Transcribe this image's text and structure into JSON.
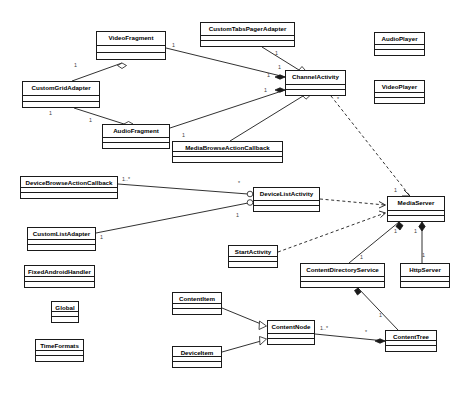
{
  "diagram": {
    "type": "uml-class-diagram",
    "title": "",
    "canvas": {
      "width": 464,
      "height": 394
    },
    "colors": {
      "stroke": "#1a1a1a",
      "fill": "#ffffff",
      "text": "#000000",
      "multiplicity_text": "#3d3d3d"
    },
    "classes": [
      {
        "id": "video_fragment",
        "name": "VideoFragment",
        "x": 96,
        "y": 31,
        "w": 70,
        "h": 29
      },
      {
        "id": "custom_tabs_pager_adapter",
        "name": "CustomTabsPagerAdapter",
        "x": 200,
        "y": 22,
        "w": 95,
        "h": 25
      },
      {
        "id": "audio_player",
        "name": "AudioPlayer",
        "x": 374,
        "y": 32,
        "w": 51,
        "h": 24
      },
      {
        "id": "video_player",
        "name": "VideoPlayer",
        "x": 374,
        "y": 80,
        "w": 51,
        "h": 24
      },
      {
        "id": "custom_grid_adapter",
        "name": "CustomGridAdapter",
        "x": 22,
        "y": 81,
        "w": 78,
        "h": 27
      },
      {
        "id": "channel_activity",
        "name": "ChannelActivity",
        "x": 285,
        "y": 70,
        "w": 61,
        "h": 26
      },
      {
        "id": "audio_fragment",
        "name": "AudioFragment",
        "x": 102,
        "y": 124,
        "w": 68,
        "h": 25
      },
      {
        "id": "media_browse_action_callback",
        "name": "MediaBrowseActionCallback",
        "x": 172,
        "y": 141,
        "w": 111,
        "h": 22
      },
      {
        "id": "device_browse_action_callback",
        "name": "DeviceBrowseActionCallback",
        "x": 20,
        "y": 176,
        "w": 98,
        "h": 23
      },
      {
        "id": "device_list_activity",
        "name": "DeviceListActivity",
        "x": 253,
        "y": 187,
        "w": 67,
        "h": 25
      },
      {
        "id": "media_server",
        "name": "MediaServer",
        "x": 387,
        "y": 196,
        "w": 58,
        "h": 26
      },
      {
        "id": "custom_list_adapter",
        "name": "CustomListAdapter",
        "x": 27,
        "y": 227,
        "w": 69,
        "h": 24
      },
      {
        "id": "start_activity",
        "name": "StartActivity",
        "x": 228,
        "y": 245,
        "w": 50,
        "h": 23
      },
      {
        "id": "content_directory_service",
        "name": "ContentDirectoryService",
        "x": 300,
        "y": 263,
        "w": 85,
        "h": 25
      },
      {
        "id": "http_server",
        "name": "HttpServer",
        "x": 400,
        "y": 263,
        "w": 50,
        "h": 25
      },
      {
        "id": "fixed_android_handler",
        "name": "FixedAndroidHandler",
        "x": 24,
        "y": 265,
        "w": 71,
        "h": 23
      },
      {
        "id": "content_item",
        "name": "ContentItem",
        "x": 172,
        "y": 292,
        "w": 50,
        "h": 23
      },
      {
        "id": "global",
        "name": "Global",
        "x": 51,
        "y": 301,
        "w": 28,
        "h": 22
      },
      {
        "id": "content_node",
        "name": "ContentNode",
        "x": 267,
        "y": 320,
        "w": 48,
        "h": 25
      },
      {
        "id": "content_tree",
        "name": "ContentTree",
        "x": 385,
        "y": 330,
        "w": 52,
        "h": 22
      },
      {
        "id": "time_formats",
        "name": "TimeFormats",
        "x": 35,
        "y": 339,
        "w": 49,
        "h": 23
      },
      {
        "id": "device_item",
        "name": "DeviceItem",
        "x": 172,
        "y": 346,
        "w": 50,
        "h": 22
      }
    ],
    "multiplicities": [
      {
        "id": "m1",
        "label": "1",
        "x": 74,
        "y": 63
      },
      {
        "id": "m2",
        "label": "1",
        "x": 172,
        "y": 43
      },
      {
        "id": "m3",
        "label": "1",
        "x": 275,
        "y": 51
      },
      {
        "id": "m4",
        "label": "1",
        "x": 278,
        "y": 65
      },
      {
        "id": "m5",
        "label": "1",
        "x": 267,
        "y": 73
      },
      {
        "id": "m6",
        "label": "1",
        "x": 264,
        "y": 88
      },
      {
        "id": "m7",
        "label": "1",
        "x": 49,
        "y": 111
      },
      {
        "id": "m8",
        "label": "1",
        "x": 89,
        "y": 118
      },
      {
        "id": "m9",
        "label": "1",
        "x": 182,
        "y": 133
      },
      {
        "id": "m10",
        "label": "1..*",
        "x": 122,
        "y": 177
      },
      {
        "id": "m11",
        "label": "*",
        "x": 238,
        "y": 181
      },
      {
        "id": "m12",
        "label": "1",
        "x": 236,
        "y": 213
      },
      {
        "id": "m13",
        "label": "1",
        "x": 100,
        "y": 235
      },
      {
        "id": "m14",
        "label": "1",
        "x": 394,
        "y": 188
      },
      {
        "id": "m15",
        "label": "1",
        "x": 394,
        "y": 229
      },
      {
        "id": "m16",
        "label": "1",
        "x": 414,
        "y": 229
      },
      {
        "id": "m17",
        "label": "1",
        "x": 360,
        "y": 255
      },
      {
        "id": "m18",
        "label": "1",
        "x": 422,
        "y": 253
      },
      {
        "id": "m19",
        "label": "1",
        "x": 379,
        "y": 313
      },
      {
        "id": "m20",
        "label": "1..*",
        "x": 320,
        "y": 326
      },
      {
        "id": "m21",
        "label": "*",
        "x": 365,
        "y": 330
      },
      {
        "id": "m22",
        "label": "*",
        "x": 337,
        "y": 97
      }
    ],
    "relationships": [
      {
        "id": "r1",
        "from": "custom_grid_adapter",
        "to": "video_fragment",
        "kind": "aggregation"
      },
      {
        "id": "r2",
        "from": "custom_grid_adapter",
        "to": "audio_fragment",
        "kind": "aggregation"
      },
      {
        "id": "r3",
        "from": "video_fragment",
        "to": "channel_activity",
        "kind": "composition"
      },
      {
        "id": "r4",
        "from": "audio_fragment",
        "to": "channel_activity",
        "kind": "composition"
      },
      {
        "id": "r5",
        "from": "custom_tabs_pager_adapter",
        "to": "channel_activity",
        "kind": "aggregation"
      },
      {
        "id": "r6",
        "from": "media_browse_action_callback",
        "to": "channel_activity",
        "kind": "aggregation"
      },
      {
        "id": "r7",
        "from": "channel_activity",
        "to": "media_server",
        "kind": "dependency"
      },
      {
        "id": "r8",
        "from": "device_browse_action_callback",
        "to": "device_list_activity",
        "kind": "aggregation"
      },
      {
        "id": "r9",
        "from": "custom_list_adapter",
        "to": "device_list_activity",
        "kind": "aggregation"
      },
      {
        "id": "r10",
        "from": "device_list_activity",
        "to": "media_server",
        "kind": "dependency"
      },
      {
        "id": "r11",
        "from": "start_activity",
        "to": "media_server",
        "kind": "dependency"
      },
      {
        "id": "r12",
        "from": "content_directory_service",
        "to": "media_server",
        "kind": "composition"
      },
      {
        "id": "r13",
        "from": "http_server",
        "to": "media_server",
        "kind": "composition"
      },
      {
        "id": "r14",
        "from": "content_tree",
        "to": "content_directory_service",
        "kind": "composition"
      },
      {
        "id": "r15",
        "from": "content_node",
        "to": "content_tree",
        "kind": "composition"
      },
      {
        "id": "r16",
        "from": "content_item",
        "to": "content_node",
        "kind": "generalization"
      },
      {
        "id": "r17",
        "from": "device_item",
        "to": "content_node",
        "kind": "generalization"
      }
    ]
  }
}
